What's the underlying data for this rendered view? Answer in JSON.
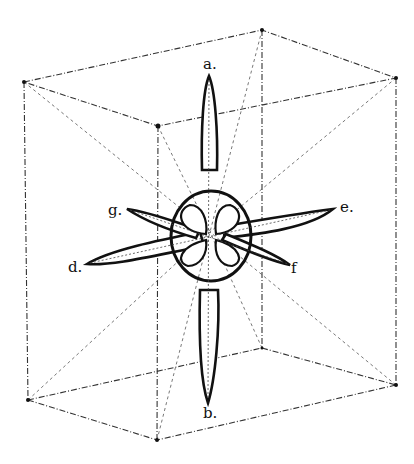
{
  "figure": {
    "labels": {
      "a": "a.",
      "b": "b.",
      "d": "d.",
      "e": "e.",
      "f": "f",
      "g": "g."
    },
    "colors": {
      "ink": "#111111",
      "background": "#ffffff"
    }
  }
}
